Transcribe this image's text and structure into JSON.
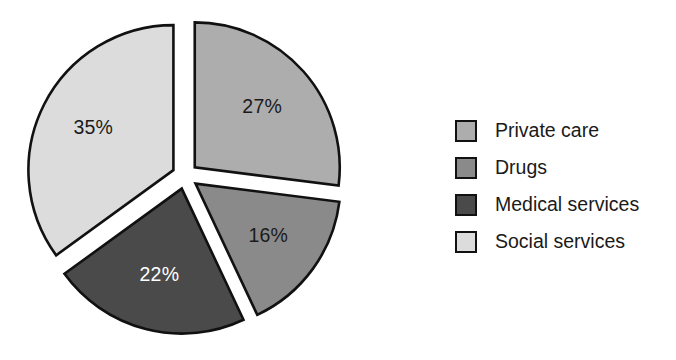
{
  "chart": {
    "type": "pie",
    "exploded": true,
    "background": "#ffffff",
    "center_x": 185,
    "center_y": 176,
    "radius": 145,
    "explode_offset": 13,
    "start_angle_deg": 0
  },
  "chart_data": {
    "type": "pie",
    "title": "",
    "categories": [
      "Private care",
      "Drugs",
      "Medical services",
      "Social services"
    ],
    "values": [
      27,
      16,
      22,
      35
    ],
    "labels": [
      "27%",
      "16%",
      "22%",
      "35%"
    ],
    "units": "percent",
    "total": 100,
    "legend_position": "right",
    "grid": false,
    "slices": [
      {
        "name": "Private care",
        "value": 27,
        "label": "27%",
        "color": "#adadad",
        "label_color": "#1a1a1a",
        "start_deg": 0,
        "end_deg": 97.2
      },
      {
        "name": "Drugs",
        "value": 16,
        "label": "16%",
        "color": "#8a8a8a",
        "label_color": "#1a1a1a",
        "start_deg": 97.2,
        "end_deg": 154.8
      },
      {
        "name": "Medical services",
        "value": 22,
        "label": "22%",
        "color": "#4a4a4a",
        "label_color": "#ffffff",
        "start_deg": 154.8,
        "end_deg": 234.0
      },
      {
        "name": "Social services",
        "value": 35,
        "label": "35%",
        "color": "#dcdcdc",
        "label_color": "#1a1a1a",
        "start_deg": 234.0,
        "end_deg": 360.0
      }
    ],
    "outline_color": "#111111"
  },
  "legend": {
    "items": [
      {
        "label": "Private care",
        "color": "#adadad"
      },
      {
        "label": "Drugs",
        "color": "#8a8a8a"
      },
      {
        "label": "Medical services",
        "color": "#4a4a4a"
      },
      {
        "label": "Social services",
        "color": "#dcdcdc"
      }
    ]
  }
}
